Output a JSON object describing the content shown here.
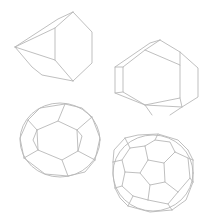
{
  "diagram": {
    "background": "#ffffff",
    "stroke_color": "#b8b8b8",
    "shapes": [
      {
        "name": "truncated-tetrahedron",
        "polylines": [
          [
            [
              15,
              47
            ],
            [
              58,
              19
            ],
            [
              73,
              12
            ]
          ],
          [
            [
              15,
              47
            ],
            [
              55,
              28
            ],
            [
              73,
              12
            ]
          ],
          [
            [
              73,
              12
            ],
            [
              92,
              32
            ],
            [
              92,
              63
            ],
            [
              73,
              81
            ]
          ],
          [
            [
              15,
              47
            ],
            [
              32,
              67
            ],
            [
              42,
              75
            ],
            [
              73,
              81
            ]
          ],
          [
            [
              15,
              47
            ],
            [
              55,
              60
            ],
            [
              73,
              81
            ]
          ],
          [
            [
              55,
              28
            ],
            [
              55,
              60
            ]
          ]
        ]
      },
      {
        "name": "truncated-octahedron",
        "polylines": [
          [
            [
              160,
              40
            ],
            [
              150,
              43
            ],
            [
              115,
              67
            ],
            [
              115,
              93
            ],
            [
              145,
              105
            ],
            [
              182,
              107
            ],
            [
              198,
              97
            ],
            [
              198,
              68
            ],
            [
              180,
              52
            ],
            [
              160,
              40
            ]
          ],
          [
            [
              160,
              40
            ],
            [
              145,
              50
            ],
            [
              123,
              67
            ],
            [
              123,
              92
            ],
            [
              145,
              105
            ]
          ],
          [
            [
              145,
              50
            ],
            [
              180,
              65
            ],
            [
              180,
              98
            ],
            [
              145,
              105
            ]
          ],
          [
            [
              180,
              65
            ],
            [
              180,
              52
            ]
          ],
          [
            [
              180,
              98
            ],
            [
              182,
              107
            ]
          ],
          [
            [
              115,
              67
            ],
            [
              123,
              67
            ]
          ],
          [
            [
              115,
              93
            ],
            [
              123,
              92
            ]
          ],
          [
            [
              145,
              105
            ],
            [
              152,
              115
            ]
          ],
          [
            [
              182,
              107
            ],
            [
              170,
              115
            ]
          ]
        ]
      },
      {
        "name": "truncated-icosidodecahedron-like",
        "ellipse": {
          "cx": 60,
          "cy": 140,
          "rx": 40,
          "ry": 37
        },
        "polylines": [
          [
            [
              37,
              130
            ],
            [
              58,
              121
            ],
            [
              77,
              130
            ],
            [
              78,
              151
            ],
            [
              62,
              160
            ],
            [
              38,
              150
            ],
            [
              37,
              130
            ]
          ],
          [
            [
              37,
              130
            ],
            [
              28,
              120
            ]
          ],
          [
            [
              58,
              121
            ],
            [
              65,
              104
            ]
          ],
          [
            [
              77,
              130
            ],
            [
              92,
              117
            ]
          ],
          [
            [
              78,
              151
            ],
            [
              95,
              160
            ]
          ],
          [
            [
              62,
              160
            ],
            [
              68,
              176
            ]
          ],
          [
            [
              38,
              150
            ],
            [
              24,
              158
            ]
          ],
          [
            [
              28,
              120
            ],
            [
              40,
              108
            ],
            [
              65,
              104
            ]
          ],
          [
            [
              65,
              104
            ],
            [
              82,
              108
            ],
            [
              92,
              117
            ]
          ],
          [
            [
              92,
              117
            ],
            [
              100,
              138
            ],
            [
              95,
              160
            ]
          ],
          [
            [
              95,
              160
            ],
            [
              85,
              172
            ],
            [
              68,
              176
            ]
          ],
          [
            [
              68,
              176
            ],
            [
              45,
              174
            ],
            [
              24,
              158
            ]
          ],
          [
            [
              24,
              158
            ],
            [
              20,
              138
            ],
            [
              28,
              120
            ]
          ],
          [
            [
              77,
              130
            ],
            [
              82,
              136
            ],
            [
              78,
              151
            ]
          ],
          [
            [
              37,
              130
            ],
            [
              33,
              140
            ],
            [
              38,
              150
            ]
          ]
        ]
      },
      {
        "name": "truncated-icosahedron-soccer-ball",
        "ellipse": {
          "cx": 153,
          "cy": 173,
          "rx": 40,
          "ry": 38
        },
        "polylines": [
          [
            [
              148,
              160
            ],
            [
              164,
              163
            ],
            [
              165,
              182
            ],
            [
              150,
              185
            ],
            [
              140,
              173
            ],
            [
              148,
              160
            ]
          ],
          [
            [
              148,
              160
            ],
            [
              145,
              146
            ]
          ],
          [
            [
              164,
              163
            ],
            [
              175,
              152
            ]
          ],
          [
            [
              165,
              182
            ],
            [
              178,
              192
            ]
          ],
          [
            [
              150,
              185
            ],
            [
              148,
              200
            ]
          ],
          [
            [
              140,
              173
            ],
            [
              125,
              172
            ]
          ],
          [
            [
              145,
              146
            ],
            [
              130,
              148
            ],
            [
              122,
              160
            ],
            [
              125,
              172
            ]
          ],
          [
            [
              145,
              146
            ],
            [
              155,
              140
            ],
            [
              170,
              142
            ],
            [
              175,
              152
            ]
          ],
          [
            [
              175,
              152
            ],
            [
              188,
              158
            ],
            [
              190,
              178
            ],
            [
              178,
              192
            ]
          ],
          [
            [
              178,
              192
            ],
            [
              168,
              204
            ],
            [
              148,
              200
            ]
          ],
          [
            [
              148,
              200
            ],
            [
              133,
              196
            ],
            [
              122,
              186
            ],
            [
              125,
              172
            ]
          ],
          [
            [
              130,
              148
            ],
            [
              125,
              138
            ]
          ],
          [
            [
              155,
              140
            ],
            [
              158,
              134
            ]
          ],
          [
            [
              188,
              158
            ],
            [
              193,
              160
            ]
          ],
          [
            [
              190,
              178
            ],
            [
              193,
              182
            ]
          ],
          [
            [
              168,
              204
            ],
            [
              172,
              210
            ]
          ],
          [
            [
              133,
              196
            ],
            [
              128,
              206
            ]
          ],
          [
            [
              122,
              160
            ],
            [
              113,
              162
            ]
          ],
          [
            [
              122,
              186
            ],
            [
              115,
              188
            ]
          ],
          [
            [
              125,
              138
            ],
            [
              138,
              135
            ],
            [
              158,
              134
            ],
            [
              178,
              140
            ],
            [
              188,
              150
            ]
          ],
          [
            [
              113,
              162
            ],
            [
              114,
              150
            ],
            [
              125,
              138
            ]
          ],
          [
            [
              115,
              188
            ],
            [
              113,
              175
            ],
            [
              113,
              162
            ]
          ],
          [
            [
              128,
              206
            ],
            [
              120,
              198
            ],
            [
              115,
              188
            ]
          ],
          [
            [
              172,
              210
            ],
            [
              150,
              212
            ],
            [
              128,
              206
            ]
          ],
          [
            [
              193,
              182
            ],
            [
              186,
              200
            ],
            [
              172,
              210
            ]
          ],
          [
            [
              193,
              160
            ],
            [
              193,
              182
            ]
          ],
          [
            [
              188,
              150
            ],
            [
              193,
              160
            ]
          ]
        ]
      }
    ]
  }
}
